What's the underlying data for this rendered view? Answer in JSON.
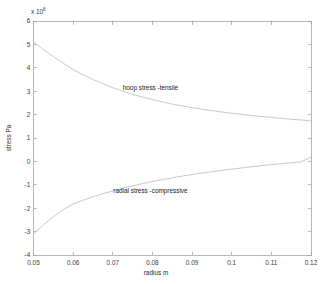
{
  "figure": {
    "background_color": "#ffffff",
    "axis_color": "#9a9a9a",
    "curve_color": "#b9b9b9",
    "text_color": "#1a1a1a"
  },
  "axes": {
    "y_exponent_prefix": "x 10",
    "y_exponent_power": "8",
    "y_label": "stress  Pa",
    "x_label": "radius  m",
    "y_ticks": [
      "6",
      "5",
      "4",
      "3",
      "2",
      "1",
      "0",
      "-1",
      "-2",
      "-3",
      "-4"
    ],
    "x_ticks": [
      "0.05",
      "0.06",
      "0.07",
      "0.08",
      "0.09",
      "0.1",
      "0.11",
      "0.12"
    ]
  },
  "annotations": {
    "hoop": "hoop stress  -tensile",
    "radial": "radial stress  -compressive"
  },
  "chart_data": {
    "type": "line",
    "title": "",
    "xlabel": "radius  m",
    "ylabel": "stress  Pa",
    "y_scale_factor": 100000000.0,
    "y_scale_label": "x 10^8",
    "xlim": [
      0.05,
      0.12
    ],
    "ylim": [
      -4,
      6
    ],
    "xticks": [
      0.05,
      0.06,
      0.07,
      0.08,
      0.09,
      0.1,
      0.11,
      0.12
    ],
    "yticks": [
      -4,
      -3,
      -2,
      -1,
      0,
      1,
      2,
      3,
      4,
      5,
      6
    ],
    "grid": false,
    "legend": "none (inline annotations)",
    "series": [
      {
        "name": "hoop stress  -tensile",
        "color": "#b9b9b9",
        "x": [
          0.05,
          0.0525,
          0.055,
          0.0575,
          0.06,
          0.0625,
          0.065,
          0.0675,
          0.07,
          0.0725,
          0.075,
          0.0775,
          0.08,
          0.0825,
          0.085,
          0.0875,
          0.09,
          0.0925,
          0.095,
          0.0975,
          0.1,
          0.1025,
          0.105,
          0.1075,
          0.11,
          0.1125,
          0.115,
          0.1175,
          0.12
        ],
        "values": [
          5.1,
          4.78,
          4.48,
          4.2,
          3.92,
          3.7,
          3.5,
          3.32,
          3.15,
          3.0,
          2.87,
          2.75,
          2.64,
          2.54,
          2.45,
          2.37,
          2.3,
          2.23,
          2.17,
          2.11,
          2.06,
          2.01,
          1.96,
          1.92,
          1.88,
          1.84,
          1.8,
          1.77,
          1.73
        ]
      },
      {
        "name": "radial stress  -compressive",
        "color": "#b9b9b9",
        "x": [
          0.05,
          0.0525,
          0.055,
          0.0575,
          0.06,
          0.0625,
          0.065,
          0.0675,
          0.07,
          0.0725,
          0.075,
          0.0775,
          0.08,
          0.0825,
          0.085,
          0.0875,
          0.09,
          0.0925,
          0.095,
          0.0975,
          0.1,
          0.1025,
          0.105,
          0.1075,
          0.11,
          0.1125,
          0.115,
          0.1175,
          0.12
        ],
        "values": [
          -3.1,
          -2.72,
          -2.36,
          -2.06,
          -1.82,
          -1.66,
          -1.51,
          -1.38,
          -1.26,
          -1.15,
          -1.05,
          -0.95,
          -0.86,
          -0.78,
          -0.7,
          -0.63,
          -0.56,
          -0.5,
          -0.44,
          -0.38,
          -0.33,
          -0.28,
          -0.23,
          -0.18,
          -0.14,
          -0.1,
          -0.06,
          -0.02,
          0.18
        ]
      }
    ],
    "annotations": [
      {
        "text": "hoop stress  -tensile",
        "x": 0.0795,
        "y": 3.05
      },
      {
        "text": "radial stress  -compressive",
        "x": 0.0795,
        "y": -1.33
      }
    ]
  }
}
